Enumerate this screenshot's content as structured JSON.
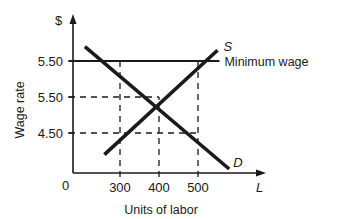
{
  "chart_data": {
    "type": "line",
    "title": "",
    "xlabel": "Units of labor",
    "ylabel": "Wage rate",
    "x_axis_symbol": "L",
    "y_axis_symbol": "$",
    "origin_label": "0",
    "xlim": [
      250,
      600
    ],
    "ylim": [
      3.5,
      7.0
    ],
    "grid": false,
    "x_ticks": [
      {
        "value": 300,
        "label": "300"
      },
      {
        "value": 400,
        "label": "400"
      },
      {
        "value": 500,
        "label": "500"
      }
    ],
    "y_ticks": [
      {
        "value": 6.5,
        "label": "5.50"
      },
      {
        "value": 5.5,
        "label": "5.50"
      },
      {
        "value": 4.5,
        "label": "4.50"
      }
    ],
    "series": [
      {
        "name": "D",
        "label": "D",
        "style": "solid",
        "points": [
          [
            210,
            6.9
          ],
          [
            580,
            3.5
          ]
        ]
      },
      {
        "name": "S",
        "label": "S",
        "style": "solid",
        "points": [
          [
            260,
            3.9
          ],
          [
            550,
            6.8
          ]
        ]
      },
      {
        "name": "Minimum wage",
        "label": "Minimum wage",
        "style": "solid",
        "points": [
          [
            250,
            6.5
          ],
          [
            555,
            6.5
          ]
        ]
      }
    ],
    "reference_lines": [
      {
        "type": "horizontal",
        "y": 5.5,
        "x_to": 400,
        "style": "dashed"
      },
      {
        "type": "horizontal",
        "y": 4.5,
        "x_to": 500,
        "style": "dashed"
      },
      {
        "type": "vertical",
        "x": 300,
        "y_to": 6.5,
        "style": "dashed"
      },
      {
        "type": "vertical",
        "x": 400,
        "y_to": 5.5,
        "style": "dashed"
      },
      {
        "type": "vertical",
        "x": 500,
        "y_to": 6.5,
        "style": "dashed"
      }
    ]
  }
}
